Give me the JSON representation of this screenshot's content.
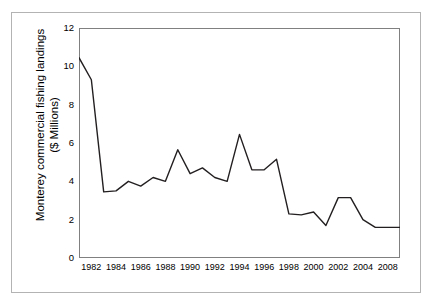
{
  "chart_data": {
    "type": "line",
    "title": "",
    "xlabel": "",
    "ylabel": "Monterey commercial fishing landings ($ Millions)",
    "ylabel_line1": "Monterey commercial fishing landings",
    "ylabel_line2": "($ Millions)",
    "ylim": [
      0,
      12
    ],
    "xlim": [
      1981,
      2007
    ],
    "ytick_labels": [
      "12",
      "10",
      "8",
      "6",
      "4",
      "2",
      "0"
    ],
    "ytick_values": [
      12,
      10,
      8,
      6,
      4,
      2,
      0
    ],
    "xtick_labels": [
      "1982",
      "1984",
      "1986",
      "1988",
      "1990",
      "1992",
      "1994",
      "1996",
      "1998",
      "2000",
      "2002",
      "2004",
      "2008"
    ],
    "xtick_values": [
      1982,
      1984,
      1986,
      1988,
      1990,
      1992,
      1994,
      1996,
      1998,
      2000,
      2002,
      2004,
      2006
    ],
    "grid": false,
    "legend": false,
    "line_color": "#231f20",
    "line_width": 1.4,
    "x": [
      1981,
      1982,
      1983,
      1984,
      1985,
      1986,
      1987,
      1988,
      1989,
      1990,
      1991,
      1992,
      1993,
      1994,
      1995,
      1996,
      1997,
      1998,
      1999,
      2000,
      2001,
      2002,
      2003,
      2004,
      2005,
      2006,
      2007
    ],
    "values": [
      10.45,
      9.3,
      3.45,
      3.5,
      4.0,
      3.75,
      4.2,
      4.0,
      5.65,
      4.4,
      4.7,
      4.2,
      4.0,
      6.45,
      4.6,
      4.6,
      5.15,
      2.3,
      2.25,
      2.4,
      1.7,
      3.15,
      3.15,
      2.0,
      1.6,
      1.6,
      1.6
    ],
    "series": [
      {
        "name": "Monterey commercial fishing landings",
        "values": [
          10.45,
          9.3,
          3.45,
          3.5,
          4.0,
          3.75,
          4.2,
          4.0,
          5.65,
          4.4,
          4.7,
          4.2,
          4.0,
          6.45,
          4.6,
          4.6,
          5.15,
          2.3,
          2.25,
          2.4,
          1.7,
          3.15,
          3.15,
          2.0,
          1.6,
          1.6,
          1.6
        ]
      }
    ]
  },
  "figure": {
    "background": "#ffffff",
    "frame_color": "#b3b3b3",
    "axis_color": "#808080"
  }
}
